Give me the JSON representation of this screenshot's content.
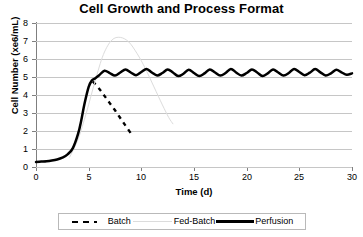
{
  "chart_data": {
    "type": "line",
    "title": "Cell Growth and Process Format",
    "xlabel": "Time (d)",
    "ylabel": "Cell Number (xe6/mL)",
    "xlim": [
      0,
      30
    ],
    "ylim": [
      0,
      8
    ],
    "xticks": [
      0,
      5,
      10,
      15,
      20,
      25,
      30
    ],
    "yticks": [
      0,
      1,
      2,
      3,
      4,
      5,
      6,
      7,
      8
    ],
    "grid": "horizontal",
    "legend_position": "bottom",
    "series": [
      {
        "name": "Batch",
        "style": "dashed",
        "color": "#000000",
        "x": [
          5.4,
          6.0,
          6.5,
          7.0,
          7.5,
          8.0,
          8.5,
          9.0
        ],
        "y": [
          4.75,
          4.35,
          3.95,
          3.55,
          3.15,
          2.72,
          2.3,
          1.88
        ]
      },
      {
        "name": "Fed-Batch",
        "style": "thin-light",
        "color": "#dcdcdc",
        "x": [
          3.2,
          4.0,
          4.8,
          5.6,
          6.4,
          7.2,
          8.0,
          8.8,
          9.6,
          10.4,
          11.2,
          12.0,
          12.6,
          13.0
        ],
        "y": [
          0.55,
          1.55,
          3.05,
          4.75,
          6.25,
          7.05,
          7.2,
          6.95,
          6.3,
          5.45,
          4.45,
          3.45,
          2.75,
          2.4
        ]
      },
      {
        "name": "Perfusion",
        "style": "thick-solid",
        "color": "#000000",
        "x": [
          0.0,
          0.5,
          1.0,
          1.5,
          2.0,
          2.5,
          3.0,
          3.5,
          4.0,
          4.3,
          4.6,
          5.0,
          5.3,
          5.6,
          6.0,
          6.5,
          7.0,
          7.5,
          8.0,
          8.5,
          9.0,
          9.5,
          10.0,
          10.5,
          11.0,
          11.5,
          12.0,
          12.5,
          13.0,
          13.5,
          14.0,
          14.5,
          15.0,
          15.5,
          16.0,
          16.5,
          17.0,
          17.5,
          18.0,
          18.5,
          19.0,
          19.5,
          20.0,
          20.5,
          21.0,
          21.5,
          22.0,
          22.5,
          23.0,
          23.5,
          24.0,
          24.5,
          25.0,
          25.5,
          26.0,
          26.5,
          27.0,
          27.5,
          28.0,
          28.5,
          29.0,
          29.5,
          30.0
        ],
        "y": [
          0.28,
          0.3,
          0.32,
          0.36,
          0.42,
          0.52,
          0.7,
          1.05,
          1.85,
          2.6,
          3.5,
          4.45,
          4.8,
          4.92,
          5.1,
          5.35,
          5.22,
          5.08,
          5.25,
          5.42,
          5.25,
          5.1,
          5.28,
          5.45,
          5.25,
          5.08,
          5.22,
          5.42,
          5.25,
          5.05,
          5.18,
          5.4,
          5.22,
          5.05,
          5.2,
          5.42,
          5.25,
          5.08,
          5.22,
          5.45,
          5.25,
          5.08,
          5.22,
          5.42,
          5.25,
          5.05,
          5.2,
          5.42,
          5.25,
          5.08,
          5.22,
          5.45,
          5.28,
          5.1,
          5.24,
          5.44,
          5.26,
          5.08,
          5.2,
          5.4,
          5.26,
          5.12,
          5.2
        ]
      }
    ]
  },
  "legend": {
    "items": [
      {
        "label": "Batch"
      },
      {
        "label": "Fed-Batch"
      },
      {
        "label": "Perfusion"
      }
    ]
  }
}
